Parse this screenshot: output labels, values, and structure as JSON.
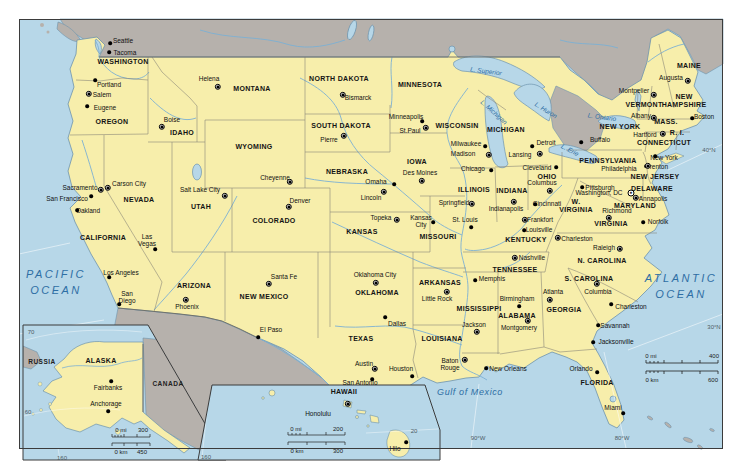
{
  "map": {
    "colors": {
      "land": "#f7eeab",
      "foreign_land": "#b6b1ac",
      "water": "#b7d7e8",
      "river": "#7cb0d4",
      "coast": "#6d93ad",
      "state_border": "#8c8878",
      "country_border": "#6e6c64",
      "water_label": "#2e6ea4",
      "frame": "#3b3b3b"
    },
    "oceans": [
      {
        "text": "PACIFIC\nOCEAN",
        "x": 56,
        "y": 283,
        "size": 11,
        "ls": 2.5
      },
      {
        "text": "ATLANTIC\nOCEAN",
        "x": 681,
        "y": 287,
        "size": 11,
        "ls": 2.5
      }
    ],
    "seas": [
      {
        "text": "Gulf of Mexico",
        "x": 470,
        "y": 392,
        "ls": 0.6
      }
    ],
    "lakes": [
      {
        "text": "L. Superior",
        "x": 486,
        "y": 71,
        "rot": 8
      },
      {
        "text": "L. Michigan",
        "x": 494,
        "y": 112,
        "rot": 42
      },
      {
        "text": "L. Huron",
        "x": 546,
        "y": 110,
        "rot": 32
      },
      {
        "text": "L. Erie",
        "x": 570,
        "y": 150,
        "rot": 28
      },
      {
        "text": "L. Ontario",
        "x": 602,
        "y": 117,
        "rot": 8
      }
    ],
    "graticules": [
      {
        "text": "40°N",
        "x": 709,
        "y": 150
      },
      {
        "text": "30°N",
        "x": 714,
        "y": 327
      },
      {
        "text": "90°W",
        "x": 478,
        "y": 438
      },
      {
        "text": "80°W",
        "x": 622,
        "y": 438
      }
    ],
    "states": [
      {
        "text": "WASHINGTON",
        "x": 123,
        "y": 62
      },
      {
        "text": "OREGON",
        "x": 112,
        "y": 122
      },
      {
        "text": "IDAHO",
        "x": 182,
        "y": 133
      },
      {
        "text": "MONTANA",
        "x": 252,
        "y": 89
      },
      {
        "text": "WYOMING",
        "x": 254,
        "y": 147
      },
      {
        "text": "NORTH DAKOTA",
        "x": 339,
        "y": 79
      },
      {
        "text": "SOUTH DAKOTA",
        "x": 341,
        "y": 126
      },
      {
        "text": "MINNESOTA",
        "x": 420,
        "y": 85
      },
      {
        "text": "WISCONSIN",
        "x": 457,
        "y": 126
      },
      {
        "text": "MICHIGAN",
        "x": 506,
        "y": 130
      },
      {
        "text": "NEBRASKA",
        "x": 347,
        "y": 172
      },
      {
        "text": "IOWA",
        "x": 417,
        "y": 162
      },
      {
        "text": "KANSAS",
        "x": 362,
        "y": 232
      },
      {
        "text": "COLORADO",
        "x": 274,
        "y": 221
      },
      {
        "text": "UTAH",
        "x": 201,
        "y": 207
      },
      {
        "text": "NEVADA",
        "x": 139,
        "y": 200
      },
      {
        "text": "CALIFORNIA",
        "x": 103,
        "y": 238
      },
      {
        "text": "ARIZONA",
        "x": 194,
        "y": 286
      },
      {
        "text": "NEW MEXICO",
        "x": 264,
        "y": 297
      },
      {
        "text": "OKLAHOMA",
        "x": 377,
        "y": 293
      },
      {
        "text": "TEXAS",
        "x": 361,
        "y": 339
      },
      {
        "text": "MISSOURI",
        "x": 438,
        "y": 237
      },
      {
        "text": "ARKANSAS",
        "x": 440,
        "y": 283
      },
      {
        "text": "LOUISIANA",
        "x": 442,
        "y": 339
      },
      {
        "text": "ILLINOIS",
        "x": 474,
        "y": 190
      },
      {
        "text": "INDIANA",
        "x": 512,
        "y": 191
      },
      {
        "text": "OHIO",
        "x": 547,
        "y": 177
      },
      {
        "text": "KENTUCKY",
        "x": 526,
        "y": 240
      },
      {
        "text": "TENNESSEE",
        "x": 515,
        "y": 270
      },
      {
        "text": "MISSISSIPPI",
        "x": 479,
        "y": 309
      },
      {
        "text": "ALABAMA",
        "x": 517,
        "y": 316
      },
      {
        "text": "GEORGIA",
        "x": 564,
        "y": 310
      },
      {
        "text": "FLORIDA",
        "x": 597,
        "y": 383
      },
      {
        "text": "S. CAROLINA",
        "x": 589,
        "y": 279
      },
      {
        "text": "N. CAROLINA",
        "x": 602,
        "y": 261
      },
      {
        "text": "VIRGINIA",
        "x": 611,
        "y": 224
      },
      {
        "text": "W.\nVIRGINIA",
        "x": 576,
        "y": 206
      },
      {
        "text": "PENNSYLVANIA",
        "x": 608,
        "y": 161
      },
      {
        "text": "NEW YORK",
        "x": 620,
        "y": 127
      },
      {
        "text": "MAINE",
        "x": 689,
        "y": 66
      },
      {
        "text": "VERMONT",
        "x": 644,
        "y": 105
      },
      {
        "text": "NEW\nHAMPSHIRE",
        "x": 684,
        "y": 101
      },
      {
        "text": "MASS.",
        "x": 666,
        "y": 122
      },
      {
        "text": "R. I.",
        "x": 677,
        "y": 133
      },
      {
        "text": "CONNECTICUT",
        "x": 664,
        "y": 143
      },
      {
        "text": "NEW JERSEY",
        "x": 655,
        "y": 177
      },
      {
        "text": "DELAWARE",
        "x": 652,
        "y": 189
      },
      {
        "text": "MARYLAND",
        "x": 635,
        "y": 206
      }
    ],
    "cities": [
      {
        "name": "Seattle",
        "x": 123,
        "y": 41,
        "mx": 110,
        "my": 43,
        "type": "city"
      },
      {
        "name": "Tacoma",
        "x": 125,
        "y": 53,
        "mx": 109,
        "my": 52,
        "type": "city"
      },
      {
        "name": "Portland",
        "x": 109,
        "y": 85,
        "mx": 95,
        "my": 80,
        "type": "city"
      },
      {
        "name": "Salem",
        "x": 102,
        "y": 95,
        "mx": 89,
        "my": 94,
        "type": "capital"
      },
      {
        "name": "Eugene",
        "x": 105,
        "y": 108,
        "mx": 87,
        "my": 106,
        "type": "city"
      },
      {
        "name": "Boise",
        "x": 172,
        "y": 120,
        "mx": 162,
        "my": 127,
        "type": "capital"
      },
      {
        "name": "Helena",
        "x": 209,
        "y": 79,
        "mx": 218,
        "my": 87,
        "type": "capital"
      },
      {
        "name": "Bismarck",
        "x": 358,
        "y": 98,
        "mx": 343,
        "my": 95,
        "type": "capital"
      },
      {
        "name": "Pierre",
        "x": 329,
        "y": 140,
        "mx": 344,
        "my": 136,
        "type": "capital"
      },
      {
        "name": "Minneapolis",
        "x": 406,
        "y": 117,
        "mx": 422,
        "my": 121,
        "type": "city"
      },
      {
        "name": "St.Paul",
        "x": 410,
        "y": 131,
        "mx": 426,
        "my": 128,
        "type": "capital"
      },
      {
        "name": "Milwaukee",
        "x": 466,
        "y": 144,
        "mx": 485,
        "my": 146,
        "type": "city"
      },
      {
        "name": "Madison",
        "x": 463,
        "y": 154,
        "mx": 489,
        "my": 155,
        "type": "capital"
      },
      {
        "name": "Chicago",
        "x": 473,
        "y": 169,
        "mx": 491,
        "my": 170,
        "type": "city"
      },
      {
        "name": "Detroit",
        "x": 546,
        "y": 143,
        "mx": 532,
        "my": 146,
        "type": "city"
      },
      {
        "name": "Lansing",
        "x": 520,
        "y": 155,
        "mx": 540,
        "my": 154,
        "type": "capital"
      },
      {
        "name": "Cleveland",
        "x": 537,
        "y": 168,
        "mx": 556,
        "my": 167,
        "type": "city"
      },
      {
        "name": "Columbus",
        "x": 542,
        "y": 183,
        "mx": 550,
        "my": 191,
        "type": "capital"
      },
      {
        "name": "Indianapolis",
        "x": 506,
        "y": 209,
        "mx": 514,
        "my": 202,
        "type": "capital"
      },
      {
        "name": "Cincinnati",
        "x": 547,
        "y": 204,
        "mx": 535,
        "my": 204,
        "type": "city"
      },
      {
        "name": "Springfield",
        "x": 454,
        "y": 203,
        "mx": 472,
        "my": 204,
        "type": "capital"
      },
      {
        "name": "St. Louis",
        "x": 465,
        "y": 220,
        "mx": 471,
        "my": 227,
        "type": "city"
      },
      {
        "name": "Kansas\nCity",
        "x": 421,
        "y": 221,
        "mx": 433,
        "my": 222,
        "type": "city"
      },
      {
        "name": "Topeka",
        "x": 381,
        "y": 218,
        "mx": 397,
        "my": 220,
        "type": "capital"
      },
      {
        "name": "Omaha",
        "x": 376,
        "y": 182,
        "mx": 394,
        "my": 184,
        "type": "city"
      },
      {
        "name": "Lincoln",
        "x": 371,
        "y": 198,
        "mx": 384,
        "my": 192,
        "type": "capital"
      },
      {
        "name": "Des Moines",
        "x": 420,
        "y": 173,
        "mx": 422,
        "my": 181,
        "type": "capital"
      },
      {
        "name": "Cheyenne",
        "x": 275,
        "y": 178,
        "mx": 290,
        "my": 182,
        "type": "capital"
      },
      {
        "name": "Denver",
        "x": 300,
        "y": 201,
        "mx": 289,
        "my": 207,
        "type": "capital"
      },
      {
        "name": "Salt Lake City",
        "x": 200,
        "y": 190,
        "mx": 225,
        "my": 196,
        "type": "capital"
      },
      {
        "name": "Sacramento",
        "x": 80,
        "y": 188,
        "mx": 101,
        "my": 190,
        "type": "capital"
      },
      {
        "name": "Carson City",
        "x": 129,
        "y": 184,
        "mx": 108,
        "my": 188,
        "type": "capital"
      },
      {
        "name": "San Francisco",
        "x": 67,
        "y": 199,
        "mx": 91,
        "my": 196,
        "type": "city"
      },
      {
        "name": "Oakland",
        "x": 88,
        "y": 211,
        "mx": 77,
        "my": 210,
        "type": "city"
      },
      {
        "name": "Las\nVegas",
        "x": 147,
        "y": 240,
        "mx": 155,
        "my": 249,
        "type": "city"
      },
      {
        "name": "Los Angeles",
        "x": 121,
        "y": 273,
        "mx": 109,
        "my": 277,
        "type": "city"
      },
      {
        "name": "San\nDiego",
        "x": 127,
        "y": 297,
        "mx": 119,
        "my": 304,
        "type": "city"
      },
      {
        "name": "Phoenix",
        "x": 187,
        "y": 307,
        "mx": 186,
        "my": 300,
        "type": "capital"
      },
      {
        "name": "Santa Fe",
        "x": 284,
        "y": 277,
        "mx": 269,
        "my": 284,
        "type": "capital"
      },
      {
        "name": "El Paso",
        "x": 271,
        "y": 330,
        "mx": 258,
        "my": 337,
        "type": "city"
      },
      {
        "name": "Oklahoma City",
        "x": 375,
        "y": 275,
        "mx": 376,
        "my": 283,
        "type": "capital"
      },
      {
        "name": "Dallas",
        "x": 397,
        "y": 324,
        "mx": 385,
        "my": 317,
        "type": "city"
      },
      {
        "name": "Austin",
        "x": 364,
        "y": 364,
        "mx": 375,
        "my": 369,
        "type": "capital"
      },
      {
        "name": "Houston",
        "x": 401,
        "y": 369,
        "mx": 412,
        "my": 376,
        "type": "city"
      },
      {
        "name": "San Antonio",
        "x": 360,
        "y": 383,
        "mx": 372,
        "my": 379,
        "type": "city"
      },
      {
        "name": "Little Rock",
        "x": 437,
        "y": 299,
        "mx": 447,
        "my": 292,
        "type": "capital"
      },
      {
        "name": "Memphis",
        "x": 492,
        "y": 279,
        "mx": 475,
        "my": 280,
        "type": "city"
      },
      {
        "name": "Nashville",
        "x": 532,
        "y": 258,
        "mx": 515,
        "my": 258,
        "type": "capital"
      },
      {
        "name": "Louisville",
        "x": 539,
        "y": 230,
        "mx": 524,
        "my": 230,
        "type": "city"
      },
      {
        "name": "Frankfort",
        "x": 540,
        "y": 220,
        "mx": 525,
        "my": 220,
        "type": "capital"
      },
      {
        "name": "Jackson",
        "x": 474,
        "y": 325,
        "mx": 477,
        "my": 332,
        "type": "capital"
      },
      {
        "name": "Birmingham",
        "x": 517,
        "y": 299,
        "mx": 519,
        "my": 306,
        "type": "city"
      },
      {
        "name": "Montgomery",
        "x": 519,
        "y": 328,
        "mx": 528,
        "my": 321,
        "type": "capital"
      },
      {
        "name": "Atlanta",
        "x": 553,
        "y": 292,
        "mx": 550,
        "my": 300,
        "type": "capital"
      },
      {
        "name": "Baton\nRouge",
        "x": 450,
        "y": 364,
        "mx": 465,
        "my": 360,
        "type": "capital"
      },
      {
        "name": "New Orleans",
        "x": 508,
        "y": 369,
        "mx": 486,
        "my": 368,
        "type": "city"
      },
      {
        "name": "Columbia",
        "x": 598,
        "y": 292,
        "mx": 597,
        "my": 284,
        "type": "capital"
      },
      {
        "name": "Charleston",
        "x": 631,
        "y": 307,
        "mx": 611,
        "my": 304,
        "type": "city"
      },
      {
        "name": "Savannah",
        "x": 615,
        "y": 326,
        "mx": 598,
        "my": 325,
        "type": "city"
      },
      {
        "name": "Jacksonville",
        "x": 616,
        "y": 342,
        "mx": 593,
        "my": 342,
        "type": "city"
      },
      {
        "name": "Orlando",
        "x": 581,
        "y": 369,
        "mx": 597,
        "my": 372,
        "type": "city"
      },
      {
        "name": "Miami",
        "x": 613,
        "y": 408,
        "mx": 623,
        "my": 413,
        "type": "city"
      },
      {
        "name": "Raleigh",
        "x": 604,
        "y": 248,
        "mx": 620,
        "my": 249,
        "type": "capital"
      },
      {
        "name": "Charleston",
        "x": 577,
        "y": 239,
        "mx": 558,
        "my": 238,
        "type": "capital"
      },
      {
        "name": "Richmond",
        "x": 617,
        "y": 211,
        "mx": 609,
        "my": 218,
        "type": "capital"
      },
      {
        "name": "Norfolk",
        "x": 658,
        "y": 222,
        "mx": 643,
        "my": 222,
        "type": "city"
      },
      {
        "name": "Washington, DC",
        "x": 599,
        "y": 193,
        "mx": 631,
        "my": 193,
        "type": "dc"
      },
      {
        "name": "Annapolis",
        "x": 653,
        "y": 199,
        "mx": 636,
        "my": 198,
        "type": "capital"
      },
      {
        "name": "Philadelphia",
        "x": 619,
        "y": 169,
        "mx": 646,
        "my": 166,
        "type": "city"
      },
      {
        "name": "Pittsburgh",
        "x": 600,
        "y": 188,
        "mx": 582,
        "my": 187,
        "type": "city"
      },
      {
        "name": "Trenton",
        "x": 657,
        "y": 167,
        "mx": 648,
        "my": 166,
        "type": "capital"
      },
      {
        "name": "New York",
        "x": 664,
        "y": 158,
        "mx": 655,
        "my": 156,
        "type": "city"
      },
      {
        "name": "Buffalo",
        "x": 600,
        "y": 140,
        "mx": 581,
        "my": 142,
        "type": "city"
      },
      {
        "name": "Albany",
        "x": 641,
        "y": 116,
        "mx": 654,
        "my": 118,
        "type": "capital"
      },
      {
        "name": "Hartford",
        "x": 645,
        "y": 135,
        "mx": 663,
        "my": 134,
        "type": "capital"
      },
      {
        "name": "Boston",
        "x": 704,
        "y": 117,
        "mx": 692,
        "my": 118,
        "type": "city"
      },
      {
        "name": "Montpelier",
        "x": 634,
        "y": 91,
        "mx": 654,
        "my": 95,
        "type": "capital"
      },
      {
        "name": "Augusta",
        "x": 671,
        "y": 78,
        "mx": 688,
        "my": 81,
        "type": "capital"
      }
    ],
    "scale_texts": [
      {
        "text": "0 mi",
        "x": 651,
        "y": 356
      },
      {
        "text": "400",
        "x": 714,
        "y": 356
      },
      {
        "text": "0 km",
        "x": 652,
        "y": 380
      },
      {
        "text": "600",
        "x": 713,
        "y": 380
      }
    ],
    "insets": {
      "alaska": {
        "states": [
          {
            "text": "ALASKA",
            "x": 101,
            "y": 361
          }
        ],
        "countries": [
          {
            "text": "RUSSIA",
            "x": 42,
            "y": 362
          },
          {
            "text": "CANADA",
            "x": 168,
            "y": 384
          }
        ],
        "cities": [
          {
            "name": "Fairbanks",
            "x": 108,
            "y": 388,
            "mx": 111,
            "my": 381,
            "type": "city"
          },
          {
            "name": "Anchorage",
            "x": 106,
            "y": 404,
            "mx": 108,
            "my": 411,
            "type": "city"
          }
        ],
        "graticules": [
          {
            "text": "70",
            "x": 31,
            "y": 332
          },
          {
            "text": "60",
            "x": 28,
            "y": 412
          },
          {
            "text": "160",
            "x": 62,
            "y": 458
          }
        ],
        "scale_texts": [
          {
            "text": "0 mi",
            "x": 121,
            "y": 430
          },
          {
            "text": "300",
            "x": 143,
            "y": 430
          },
          {
            "text": "0 km",
            "x": 121,
            "y": 452
          },
          {
            "text": "450",
            "x": 142,
            "y": 452
          }
        ]
      },
      "hawaii": {
        "states": [
          {
            "text": "HAWAII",
            "x": 344,
            "y": 392
          }
        ],
        "cities": [
          {
            "name": "Honolulu",
            "x": 318,
            "y": 414,
            "mx": 348,
            "my": 404,
            "type": "capital"
          },
          {
            "name": "Hilo",
            "x": 395,
            "y": 449,
            "mx": 406,
            "my": 442,
            "type": "city"
          }
        ],
        "graticules": [
          {
            "text": "20",
            "x": 414,
            "y": 431
          },
          {
            "text": "160",
            "x": 206,
            "y": 457
          }
        ],
        "scale_texts": [
          {
            "text": "0 mi",
            "x": 296,
            "y": 429
          },
          {
            "text": "200",
            "x": 338,
            "y": 429
          },
          {
            "text": "0 km",
            "x": 297,
            "y": 451
          },
          {
            "text": "300",
            "x": 338,
            "y": 451
          }
        ]
      }
    }
  }
}
